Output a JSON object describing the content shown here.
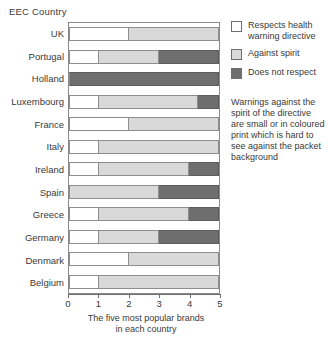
{
  "chart_data": {
    "type": "bar",
    "orientation": "horizontal",
    "stacked": true,
    "title": "",
    "ylabel": "EEC Country",
    "xlabel": "The five most popular brands in each country",
    "xlabel_lines": [
      "The five most popular brands",
      "in each country"
    ],
    "xlim": [
      0,
      5
    ],
    "xticks": [
      0,
      1,
      2,
      3,
      4,
      5
    ],
    "xtick_labels": [
      "0",
      "1",
      "2",
      "3",
      "4",
      "5"
    ],
    "grid": false,
    "legend_position": "right",
    "categories": [
      "UK",
      "Portugal",
      "Holland",
      "Luxembourg",
      "France",
      "Italy",
      "Ireland",
      "Spain",
      "Greece",
      "Germany",
      "Denmark",
      "Belgium"
    ],
    "series": [
      {
        "name": "Respects health warning directive",
        "color": "#ffffff",
        "values": [
          2,
          1,
          0,
          1,
          2,
          1,
          1,
          0,
          1,
          1,
          2,
          1
        ]
      },
      {
        "name": "Against spirit",
        "color": "#d9d9d9",
        "values": [
          3,
          2,
          0,
          3.3,
          3,
          4,
          3,
          3,
          3,
          2,
          3,
          4
        ]
      },
      {
        "name": "Does not respect",
        "color": "#6e6e6e",
        "values": [
          0,
          2,
          5,
          0.7,
          0,
          0,
          1,
          2,
          1,
          2,
          0,
          0
        ]
      }
    ],
    "annotations": [
      "Warnings against the spirit of the directive are small or in coloured print which is hard to see against the packet background"
    ]
  },
  "legend": {
    "items": [
      {
        "label_lines": [
          "Respects health",
          "warning directive"
        ],
        "swatch": "white-swatch"
      },
      {
        "label_lines": [
          "Against spirit"
        ],
        "swatch": "light-gray-swatch"
      },
      {
        "label_lines": [
          "Does not respect"
        ],
        "swatch": "dark-gray-swatch"
      }
    ]
  },
  "note": {
    "lines": [
      "Warnings against the",
      "spirit of the directive",
      "are small or in coloured",
      "print which is hard to",
      "see against the packet",
      "background"
    ]
  },
  "colors": {
    "respects": "#ffffff",
    "against_spirit": "#d9d9d9",
    "does_not_respect": "#6e6e6e",
    "outline": "#8a8a8a",
    "text": "#3a3a3a"
  }
}
